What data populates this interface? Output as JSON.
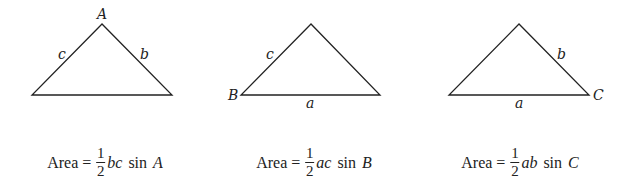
{
  "triangles": [
    {
      "vertex_label": "A",
      "left_side_label": "c",
      "right_side_label": "b",
      "base_label": "",
      "formula": {
        "prefix": "Area =",
        "num": "1",
        "den": "2",
        "sides": "bc",
        "func": "sin",
        "angle": "A"
      }
    },
    {
      "vertex_label": "B",
      "left_side_label": "c",
      "right_side_label": "",
      "base_label": "a",
      "formula": {
        "prefix": "Area =",
        "num": "1",
        "den": "2",
        "sides": "ac",
        "func": "sin",
        "angle": "B"
      }
    },
    {
      "vertex_label": "C",
      "left_side_label": "",
      "right_side_label": "b",
      "base_label": "a",
      "formula": {
        "prefix": "Area =",
        "num": "1",
        "den": "2",
        "sides": "ab",
        "func": "sin",
        "angle": "C"
      }
    }
  ],
  "colors": {
    "stroke": "#222222",
    "background": "#ffffff"
  }
}
